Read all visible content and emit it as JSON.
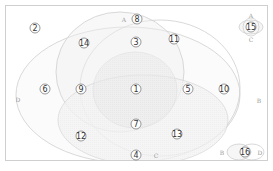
{
  "diagram": {
    "type": "venn-4-set",
    "sets": [
      "A",
      "B",
      "C",
      "D"
    ],
    "set_labels": {
      "A": "A",
      "B": "B",
      "C": "C",
      "D": "D"
    },
    "regions": [
      {
        "id": 1,
        "label": "①",
        "sets": [
          "A",
          "B",
          "C",
          "D"
        ]
      },
      {
        "id": 2,
        "label": "②",
        "sets": []
      },
      {
        "id": 3,
        "label": "③",
        "sets": [
          "A",
          "B"
        ]
      },
      {
        "id": 4,
        "label": "④",
        "sets": [
          "C"
        ]
      },
      {
        "id": 5,
        "label": "⑤",
        "sets": [
          "A",
          "B",
          "C"
        ]
      },
      {
        "id": 6,
        "label": "⑥",
        "sets": [
          "D"
        ]
      },
      {
        "id": 7,
        "label": "⑦",
        "sets": [
          "B",
          "C",
          "D"
        ]
      },
      {
        "id": 8,
        "label": "⑧",
        "sets": [
          "A"
        ]
      },
      {
        "id": 9,
        "label": "⑨",
        "sets": [
          "A",
          "C",
          "D"
        ]
      },
      {
        "id": 10,
        "label": "⑩",
        "sets": [
          "B"
        ]
      },
      {
        "id": 11,
        "label": "⑪",
        "sets": [
          "A",
          "B"
        ]
      },
      {
        "id": 12,
        "label": "⑫",
        "sets": [
          "C",
          "D"
        ]
      },
      {
        "id": 13,
        "label": "⑬",
        "sets": [
          "B",
          "C"
        ]
      },
      {
        "id": 14,
        "label": "⑭",
        "sets": [
          "A",
          "D"
        ]
      },
      {
        "id": 15,
        "label": "⑮",
        "sets": [
          "A",
          "C"
        ]
      },
      {
        "id": 16,
        "label": "⑯",
        "sets": [
          "B",
          "D"
        ]
      }
    ],
    "side_diagrams": [
      {
        "name": "A-C",
        "top_label": "A",
        "bottom_label": "C",
        "region": "⑮"
      },
      {
        "name": "B-D",
        "left_label": "B",
        "right_label": "D",
        "region": "⑯"
      }
    ]
  }
}
